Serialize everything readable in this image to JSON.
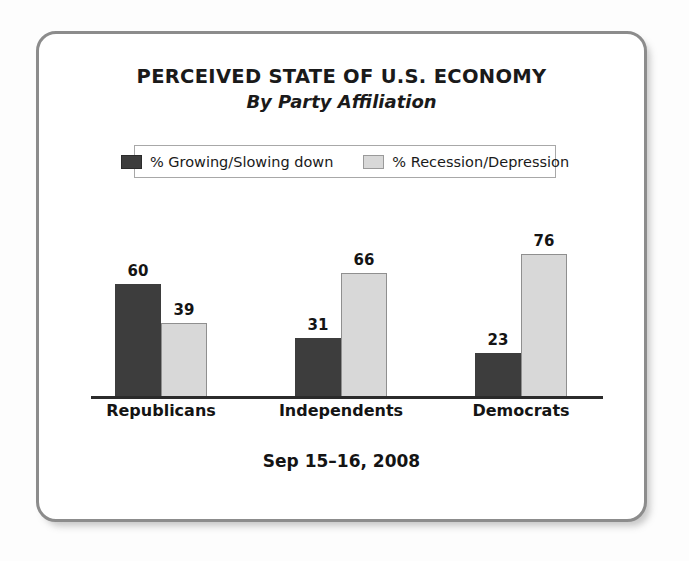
{
  "card": {
    "title": "PERCEIVED STATE OF U.S. ECONOMY",
    "subtitle": "By Party Affiliation",
    "footer_date": "Sep 15–16, 2008"
  },
  "legend": {
    "items": [
      {
        "label": "% Growing/Slowing down",
        "swatch": "dark-swatch",
        "color": "#3d3d3d"
      },
      {
        "label": "% Recession/Depression",
        "swatch": "light-swatch",
        "color": "#d8d8d8"
      }
    ]
  },
  "chart_data": {
    "type": "bar",
    "title": "PERCEIVED STATE OF U.S. ECONOMY",
    "subtitle": "By Party Affiliation",
    "xlabel": "",
    "ylabel": "",
    "ylim": [
      0,
      100
    ],
    "grid": false,
    "legend_position": "top",
    "categories": [
      "Republicans",
      "Independents",
      "Democrats"
    ],
    "series": [
      {
        "name": "% Growing/Slowing down",
        "color": "#3d3d3d",
        "values": [
          60,
          31,
          23
        ]
      },
      {
        "name": "% Recession/Depression",
        "color": "#d8d8d8",
        "values": [
          39,
          66,
          76
        ]
      }
    ],
    "annotations": [
      "Sep 15–16, 2008"
    ]
  }
}
